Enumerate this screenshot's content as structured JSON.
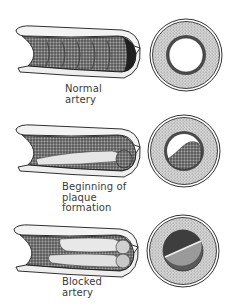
{
  "diagram": {
    "stages": [
      {
        "id": "normal",
        "label_lines": [
          "Normal",
          "artery"
        ],
        "tube": "open-lumen",
        "cross_section": "open-lumen"
      },
      {
        "id": "plaque-beginning",
        "label_lines": [
          "Beginning of",
          "plaque",
          "formation"
        ],
        "tube": "partial-plaque",
        "cross_section": "partial-plaque"
      },
      {
        "id": "blocked",
        "label_lines": [
          "Blocked",
          "artery"
        ],
        "tube": "blocked",
        "cross_section": "blocked"
      }
    ],
    "colors": {
      "ink": "#1a1a1a",
      "wall_shade": "#8a8a8a",
      "wall_light": "#d9d9d9",
      "plaque": "#6e6e6e",
      "lumen": "#ffffff",
      "text": "#3a3a3a"
    }
  }
}
